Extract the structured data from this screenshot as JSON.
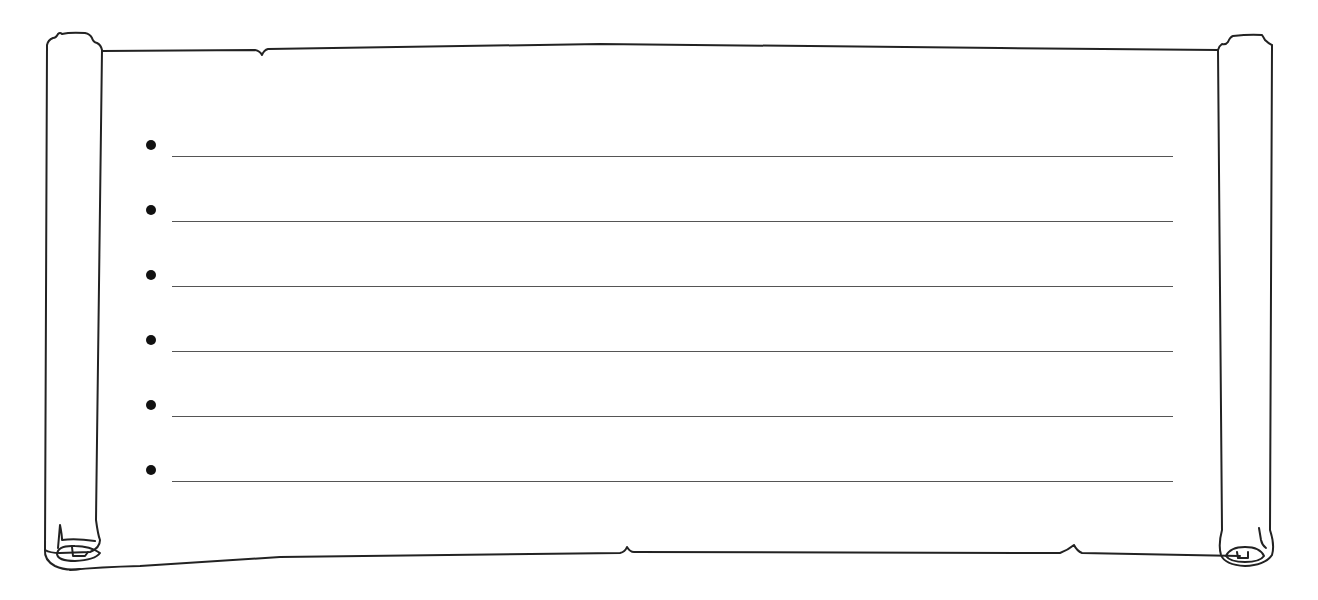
{
  "worksheet": {
    "type": "scroll-lined-template",
    "stroke_color": "#222222",
    "rule_color": "#555555",
    "background": "#ffffff",
    "lines": [
      {
        "bullet": "•",
        "text": ""
      },
      {
        "bullet": "•",
        "text": ""
      },
      {
        "bullet": "•",
        "text": ""
      },
      {
        "bullet": "•",
        "text": ""
      },
      {
        "bullet": "•",
        "text": ""
      },
      {
        "bullet": "•",
        "text": ""
      }
    ]
  }
}
